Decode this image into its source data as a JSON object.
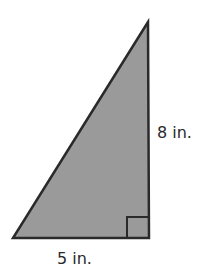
{
  "figure": {
    "shape": "right-triangle",
    "fill_color": "#9a9a9a",
    "stroke_color": "#2a2a2a",
    "height_label": "8 in.",
    "base_label": "5 in.",
    "right_angle_marker": true
  }
}
